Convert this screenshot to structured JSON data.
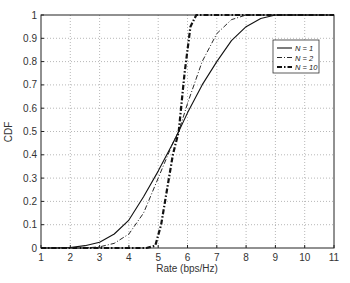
{
  "chart_data": {
    "type": "line",
    "title": "",
    "xlabel": "Rate (bps/Hz)",
    "ylabel": "CDF",
    "xlim": [
      1,
      11
    ],
    "ylim": [
      0,
      1
    ],
    "xticks": [
      "1",
      "2",
      "3",
      "4",
      "5",
      "6",
      "7",
      "8",
      "9",
      "10",
      "11"
    ],
    "yticks": [
      "0",
      "0.1",
      "0.2",
      "0.3",
      "0.4",
      "0.5",
      "0.6",
      "0.7",
      "0.8",
      "0.9",
      "1"
    ],
    "grid": true,
    "legend_position": "upper right",
    "series": [
      {
        "name": "N = 1",
        "style": "solid",
        "x": [
          1.5,
          2,
          2.5,
          3,
          3.5,
          4,
          4.5,
          5,
          5.5,
          5.7,
          6,
          6.5,
          7,
          7.5,
          8,
          8.5,
          9
        ],
        "y": [
          0,
          0.002,
          0.01,
          0.025,
          0.06,
          0.12,
          0.22,
          0.33,
          0.45,
          0.5,
          0.58,
          0.7,
          0.8,
          0.89,
          0.95,
          0.985,
          1.0
        ]
      },
      {
        "name": "N = 2",
        "style": "dash-dot",
        "x": [
          2.5,
          3,
          3.5,
          4,
          4.5,
          5,
          5.5,
          5.7,
          6,
          6.5,
          7,
          7.5,
          8
        ],
        "y": [
          0,
          0.005,
          0.02,
          0.06,
          0.15,
          0.3,
          0.45,
          0.5,
          0.62,
          0.8,
          0.92,
          0.98,
          1.0
        ]
      },
      {
        "name": "N = 10",
        "style": "thick dash-dot",
        "x": [
          4.6,
          4.9,
          5.1,
          5.3,
          5.5,
          5.7,
          5.9,
          6.1,
          6.3
        ],
        "y": [
          0,
          0.01,
          0.1,
          0.25,
          0.4,
          0.5,
          0.75,
          0.95,
          1.0
        ]
      }
    ]
  }
}
